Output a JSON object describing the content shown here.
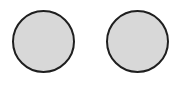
{
  "shapes": [
    {
      "id": "left-circle",
      "type": "circle",
      "fill": "#d8d8d8",
      "stroke": "#1f1f1f"
    },
    {
      "id": "right-circle",
      "type": "circle",
      "fill": "#d8d8d8",
      "stroke": "#1f1f1f"
    }
  ],
  "colors": {
    "background": "#ffffff",
    "fill": "#d8d8d8",
    "stroke": "#1f1f1f"
  }
}
